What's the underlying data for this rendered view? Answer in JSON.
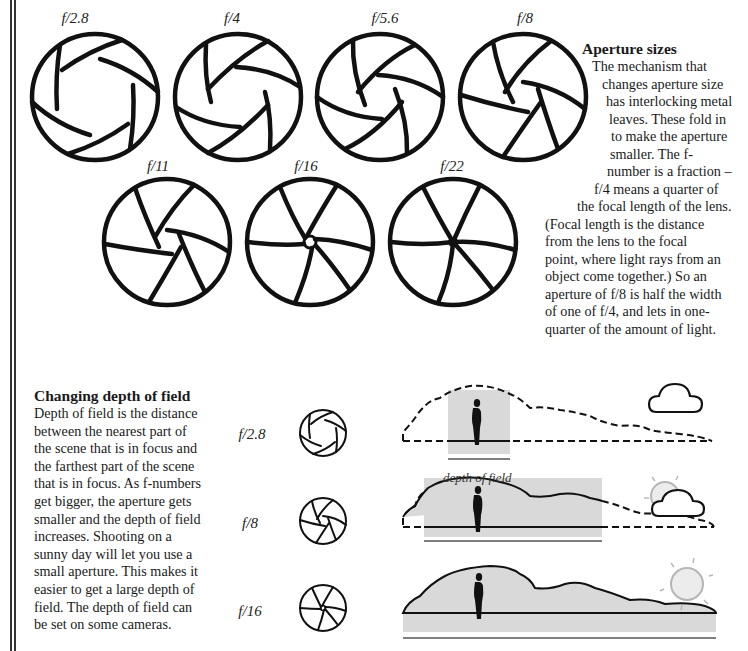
{
  "aperture_sizes": {
    "labels": [
      "f/2.8",
      "f/4",
      "f/5.6",
      "f/8",
      "f/11",
      "f/16",
      "f/22"
    ],
    "heading": "Aperture sizes",
    "lines": [
      "The mechanism that",
      "changes aperture size",
      "has interlocking metal",
      "leaves. These fold in",
      "to make the aperture",
      "smaller. The f-",
      "number is a fraction –",
      "f/4 means a quarter of",
      "the focal length of the lens.",
      "(Focal length is the distance",
      "from the lens to the focal",
      "point, where light rays from an",
      "object come together.) So an",
      "aperture of f/8 is half the width",
      "of one of f/4, and lets in one-",
      "quarter of the amount of light."
    ]
  },
  "depth_of_field": {
    "heading": "Changing depth of field",
    "lines": [
      "Depth of field is the distance",
      "between the nearest part of",
      "the scene that is in focus and",
      "the farthest part of the scene",
      "that is in focus. As f-numbers",
      "get bigger, the aperture gets",
      "smaller and the depth of field",
      "increases. Shooting on a",
      "sunny day will let you use a",
      "small aperture. This makes it",
      "easier to get a large depth of",
      "field. The depth of field can",
      "be set on some cameras."
    ],
    "rows": [
      {
        "label": "f/2.8",
        "weather": "cloud-icon"
      },
      {
        "label": "f/8",
        "weather": "sun-behind-cloud-icon"
      },
      {
        "label": "f/16",
        "weather": "sun-icon"
      }
    ],
    "caption": "depth of field"
  },
  "colors": {
    "ink": "#1a1a1a",
    "focus_fill": "#d9d9d9",
    "sun_stroke": "#b5b5b5",
    "sun_fill": "#ececec"
  }
}
